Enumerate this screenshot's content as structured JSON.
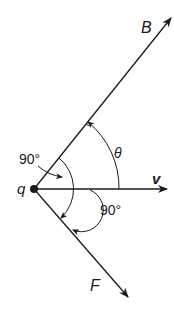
{
  "diagram": {
    "colors": {
      "ink": "#1a1a1a",
      "background": "#ffffff"
    },
    "charge": {
      "label": "q"
    },
    "vectors": {
      "magnetic_field": {
        "label": "B"
      },
      "velocity": {
        "label": "v"
      },
      "force": {
        "label": "F"
      }
    },
    "angles": {
      "theta": {
        "label": "θ"
      },
      "upper_right_angle": {
        "label": "90°"
      },
      "lower_right_angle": {
        "label": "90°"
      }
    }
  }
}
